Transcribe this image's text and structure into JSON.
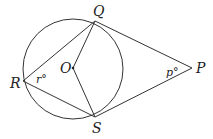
{
  "diagram": {
    "type": "circle-with-tangents",
    "points": {
      "Q": {
        "label": "Q"
      },
      "R": {
        "label": "R"
      },
      "S": {
        "label": "S"
      },
      "P": {
        "label": "P"
      },
      "O": {
        "label": "O"
      }
    },
    "angles": {
      "r": {
        "label": "r°",
        "vertex": "R"
      },
      "p": {
        "label": "p°",
        "vertex": "P"
      }
    },
    "colors": {
      "stroke": "#333333",
      "background": "#ffffff"
    }
  }
}
